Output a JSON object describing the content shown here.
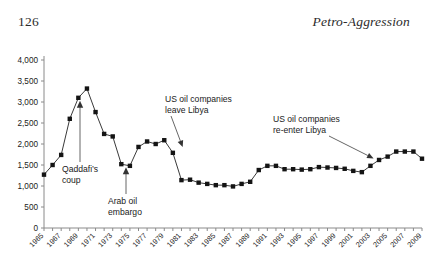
{
  "page": {
    "folio": "126",
    "running_title": "Petro-Aggression"
  },
  "chart_data": {
    "type": "line",
    "title": "",
    "xlabel": "",
    "ylabel": "",
    "xlim": [
      1965,
      2009
    ],
    "ylim": [
      0,
      4000
    ],
    "grid": false,
    "legend": "none",
    "y_ticks": [
      "0",
      "500",
      "1,000",
      "1,500",
      "2,000",
      "2,500",
      "3,000",
      "3,500",
      "4,000"
    ],
    "y_tick_values": [
      0,
      500,
      1000,
      1500,
      2000,
      2500,
      3000,
      3500,
      4000
    ],
    "x_ticks": [
      "1965",
      "1967",
      "1969",
      "1971",
      "1973",
      "1975",
      "1977",
      "1979",
      "1981",
      "1983",
      "1985",
      "1987",
      "1989",
      "1991",
      "1993",
      "1995",
      "1997",
      "1999",
      "2001",
      "2003",
      "2005",
      "2007",
      "2009"
    ],
    "x": [
      1965,
      1966,
      1967,
      1968,
      1969,
      1970,
      1971,
      1972,
      1973,
      1974,
      1975,
      1976,
      1977,
      1978,
      1979,
      1980,
      1981,
      1982,
      1983,
      1984,
      1985,
      1986,
      1987,
      1988,
      1989,
      1990,
      1991,
      1992,
      1993,
      1994,
      1995,
      1996,
      1997,
      1998,
      1999,
      2000,
      2001,
      2002,
      2003,
      2004,
      2005,
      2006,
      2007,
      2008,
      2009
    ],
    "values": [
      1270,
      1500,
      1740,
      2600,
      3100,
      3320,
      2760,
      2240,
      2180,
      1520,
      1480,
      1930,
      2060,
      2000,
      2090,
      1790,
      1140,
      1150,
      1080,
      1050,
      1020,
      1020,
      990,
      1050,
      1100,
      1380,
      1480,
      1480,
      1400,
      1400,
      1390,
      1400,
      1450,
      1440,
      1430,
      1410,
      1360,
      1330,
      1480,
      1620,
      1700,
      1820,
      1820,
      1820,
      1650
    ],
    "annotations": [
      {
        "label": "Qaddafi's coup",
        "points_to_year": 1969,
        "points_to_value": 3100
      },
      {
        "label": "Arab oil embargo",
        "points_to_year": 1974,
        "points_to_value": 1520
      },
      {
        "label": "US oil companies leave Libya",
        "points_to_year": 1981,
        "points_to_value": 1790
      },
      {
        "label": "US oil companies re-enter Libya",
        "points_to_year": 2003,
        "points_to_value": 1480
      }
    ]
  }
}
